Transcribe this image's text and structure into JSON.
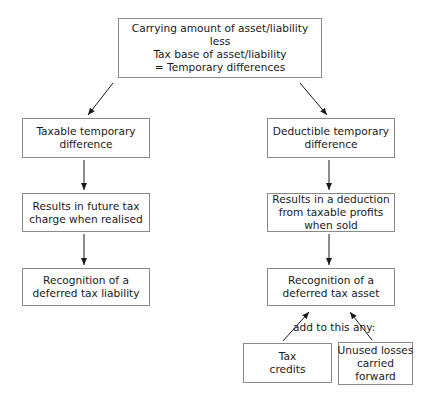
{
  "diagram": {
    "top": {
      "lines": [
        "Carrying amount of asset/liability",
        "less",
        "Tax base of asset/liability",
        "= Temporary differences"
      ]
    },
    "left_column": [
      {
        "lines": [
          "Taxable temporary",
          "difference"
        ]
      },
      {
        "lines": [
          "Results in future tax",
          "charge when realised"
        ]
      },
      {
        "lines": [
          "Recognition of a",
          "deferred tax liability"
        ]
      }
    ],
    "right_column": [
      {
        "lines": [
          "Deductible temporary",
          "difference"
        ]
      },
      {
        "lines": [
          "Results in a deduction",
          "from taxable profits",
          "when sold"
        ]
      },
      {
        "lines": [
          "Recognition of a",
          "deferred tax asset"
        ]
      }
    ],
    "additions": {
      "label": "add to this any:",
      "items": [
        {
          "lines": [
            "Tax",
            "credits"
          ]
        },
        {
          "lines": [
            "Unused losses",
            "carried",
            "forward"
          ]
        }
      ]
    },
    "colors": {
      "border": "#8a8a8a",
      "arrow": "#1a1a1a",
      "text": "#1a1a1a"
    }
  }
}
